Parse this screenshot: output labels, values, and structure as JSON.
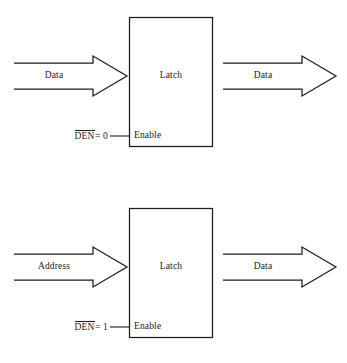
{
  "figure": {
    "type": "logic-timing-diagram",
    "stroke_color": "#1c1c1c",
    "background_color": "#ffffff"
  },
  "diagrams": [
    {
      "id": "latch-den-low",
      "block_label": "Latch",
      "enable_pin_label": "Enable",
      "control": {
        "signal_name": "DEN",
        "overbar": true,
        "equals": "=",
        "value": "0",
        "full_text": "DEN = 0"
      },
      "input_arrow": {
        "label": "Data",
        "direction": "right"
      },
      "output_arrow": {
        "label": "Data",
        "direction": "right"
      }
    },
    {
      "id": "latch-den-high",
      "block_label": "Latch",
      "enable_pin_label": "Enable",
      "control": {
        "signal_name": "DEN",
        "overbar": true,
        "equals": "=",
        "value": "1",
        "full_text": "DEN = 1"
      },
      "input_arrow": {
        "label": "Address",
        "direction": "right"
      },
      "output_arrow": {
        "label": "Data",
        "direction": "right"
      }
    }
  ]
}
